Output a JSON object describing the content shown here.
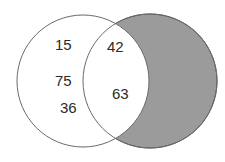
{
  "diagram": {
    "type": "venn",
    "sets": [
      {
        "name": "left-set",
        "shaded": false
      },
      {
        "name": "right-set",
        "shaded": true
      }
    ],
    "colors": {
      "background": "#ffffff",
      "shaded_region": "#9b9b9b",
      "outline": "#555555",
      "text": "#2a2a2a"
    },
    "regions": {
      "left_only": {
        "values": [
          "15",
          "75",
          "36"
        ]
      },
      "intersection": {
        "values": [
          "42",
          "63"
        ]
      },
      "right_only": {
        "values": []
      }
    }
  }
}
